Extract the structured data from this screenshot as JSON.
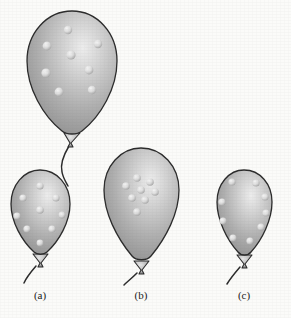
{
  "figure": {
    "background_color": "#fbfbf9",
    "balloon_body_color": "#a8a8a8",
    "balloon_highlight_color": "#e6e6e6",
    "balloon_shadow_color": "#8c8c8c",
    "outline_color": "#2b2b2b",
    "bump_color": "#e3e3e3",
    "bump_shadow_color": "#909090",
    "string_color": "#2b2b2b"
  },
  "balloons": [
    {
      "id": "balloon-top",
      "label": "",
      "distribution": "random",
      "bump_count": 8,
      "cx": 72,
      "cy": 72,
      "rx": 45,
      "ry": 62,
      "bumps": [
        {
          "x": 68,
          "y": 30,
          "r": 4.2
        },
        {
          "x": 47,
          "y": 46,
          "r": 4.4
        },
        {
          "x": 98,
          "y": 44,
          "r": 4.2
        },
        {
          "x": 71,
          "y": 55,
          "r": 4.6
        },
        {
          "x": 46,
          "y": 73,
          "r": 4.6
        },
        {
          "x": 89,
          "y": 70,
          "r": 4.4
        },
        {
          "x": 59,
          "y": 92,
          "r": 4.4
        },
        {
          "x": 92,
          "y": 90,
          "r": 4.2
        }
      ]
    },
    {
      "id": "balloon-a",
      "label": "(a)",
      "distribution": "uniform",
      "bump_count": 9,
      "cx": 40,
      "cy": 211,
      "rx": 30,
      "ry": 42,
      "bumps": [
        {
          "x": 40,
          "y": 186,
          "r": 3.6
        },
        {
          "x": 23,
          "y": 198,
          "r": 3.6
        },
        {
          "x": 56,
          "y": 198,
          "r": 3.6
        },
        {
          "x": 40,
          "y": 210,
          "r": 3.8
        },
        {
          "x": 17,
          "y": 216,
          "r": 3.6
        },
        {
          "x": 62,
          "y": 215,
          "r": 3.4
        },
        {
          "x": 27,
          "y": 229,
          "r": 3.6
        },
        {
          "x": 52,
          "y": 229,
          "r": 3.6
        },
        {
          "x": 40,
          "y": 243,
          "r": 3.4
        }
      ]
    },
    {
      "id": "balloon-b",
      "label": "(b)",
      "distribution": "clustered",
      "bump_count": 8,
      "cx": 141,
      "cy": 200,
      "rx": 38,
      "ry": 53,
      "bumps": [
        {
          "x": 137,
          "y": 178,
          "r": 3.8
        },
        {
          "x": 150,
          "y": 182,
          "r": 3.8
        },
        {
          "x": 126,
          "y": 186,
          "r": 3.8
        },
        {
          "x": 141,
          "y": 190,
          "r": 3.8
        },
        {
          "x": 155,
          "y": 192,
          "r": 3.8
        },
        {
          "x": 132,
          "y": 198,
          "r": 3.8
        },
        {
          "x": 145,
          "y": 200,
          "r": 3.8
        },
        {
          "x": 137,
          "y": 212,
          "r": 3.8
        }
      ]
    },
    {
      "id": "balloon-c",
      "label": "(c)",
      "distribution": "perimeter",
      "bump_count": 9,
      "cx": 244,
      "cy": 209,
      "rx": 28,
      "ry": 40,
      "bumps": [
        {
          "x": 232,
          "y": 182,
          "r": 3.6
        },
        {
          "x": 256,
          "y": 183,
          "r": 3.6
        },
        {
          "x": 265,
          "y": 197,
          "r": 3.6
        },
        {
          "x": 222,
          "y": 202,
          "r": 3.6
        },
        {
          "x": 266,
          "y": 213,
          "r": 3.6
        },
        {
          "x": 223,
          "y": 221,
          "r": 3.6
        },
        {
          "x": 261,
          "y": 227,
          "r": 3.6
        },
        {
          "x": 233,
          "y": 238,
          "r": 3.6
        },
        {
          "x": 250,
          "y": 241,
          "r": 3.6
        }
      ]
    }
  ],
  "labels": [
    {
      "text": "(a)",
      "x": 40,
      "y": 299
    },
    {
      "text": "(b)",
      "x": 141,
      "y": 299
    },
    {
      "text": "(c)",
      "x": 244,
      "y": 299
    }
  ]
}
